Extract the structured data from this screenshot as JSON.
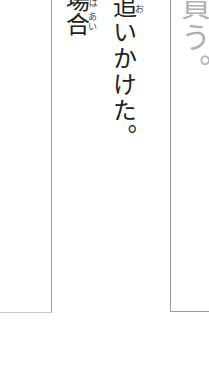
{
  "columns": [
    {
      "id": "left",
      "text": "場合",
      "ruby": "ばあい",
      "ruby_visible": "あい",
      "ruby_top_partial": "ば",
      "color": "#222222"
    },
    {
      "id": "middle",
      "text": "追いかけた。",
      "ruby": "お",
      "color": "#222222"
    },
    {
      "id": "right",
      "text": "買う。",
      "color": "#b0b0b0"
    }
  ]
}
